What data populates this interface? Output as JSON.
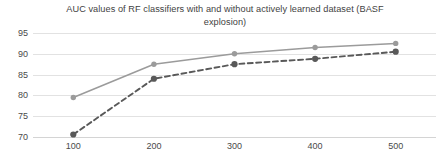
{
  "chart_data": {
    "type": "line",
    "title": "AUC values of RF classifiers with and without actively learned dataset (BASF explosion)",
    "title_line_1": "AUC values of RF classifiers with and without actively learned dataset (BASF",
    "title_line_2": "explosion)",
    "xlabel": "",
    "ylabel": "",
    "x": [
      100,
      200,
      300,
      400,
      500
    ],
    "xtick_labels": [
      "100",
      "200",
      "300",
      "400",
      "500"
    ],
    "ytick_labels": [
      "95",
      "90",
      "85",
      "80",
      "75",
      "70"
    ],
    "yticks": [
      95,
      90,
      85,
      80,
      75,
      70
    ],
    "ylim": [
      70,
      95
    ],
    "xlim": [
      50,
      550
    ],
    "grid": true,
    "legend": "none",
    "series": [
      {
        "name": "with actively learned dataset",
        "style": "solid",
        "color": "#9b9b9b",
        "marker": "circle",
        "values": [
          79.5,
          87.5,
          90.0,
          91.5,
          92.5
        ]
      },
      {
        "name": "without actively learned dataset",
        "style": "dashed",
        "color": "#595959",
        "marker": "circle",
        "values": [
          70.6,
          84.0,
          87.5,
          88.8,
          90.5
        ]
      }
    ]
  },
  "colors": {
    "gridline": "#e2e2e2",
    "baseline": "#d4d4d4",
    "text": "#404040",
    "background": "#ffffff"
  }
}
